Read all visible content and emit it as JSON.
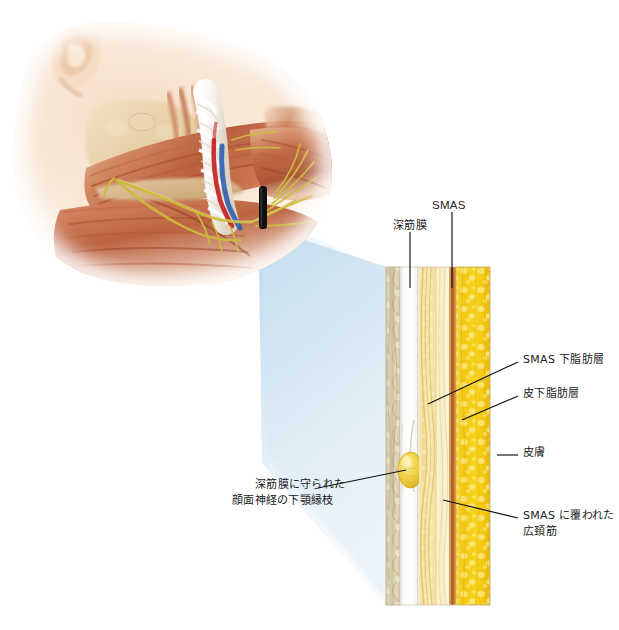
{
  "figure": {
    "type": "medical-anatomical-illustration",
    "background": "#ffffff",
    "size": {
      "width": 619,
      "height": 630
    }
  },
  "face_illustration": {
    "name": "lower-face-dissection",
    "description": "下顔面・下顎部の解剖図（表情筋・顔面神経・血管）",
    "marker": {
      "label": "",
      "shape": "vertical-black-bar",
      "color": "#101010"
    },
    "colors": {
      "skin": "#f7e2cf",
      "muscle": "#c06a4a",
      "muscle_light": "#d98f6d",
      "nerve": "#d8c44a",
      "artery": "#c02020",
      "vein": "#2a55a8",
      "bone": "#e8d7b4"
    }
  },
  "magnifier": {
    "name": "magnification-cone",
    "color": "#bcdcef",
    "description": "拡大部位を示す青い扇形"
  },
  "cross_section": {
    "name": "tissue-cross-section",
    "orientation": "vertical-strata",
    "layers": [
      {
        "id": "deep-muscle",
        "label": "",
        "color": "#d8cdae",
        "width_pct": 13
      },
      {
        "id": "deep-fascia",
        "label": "深筋膜",
        "color": "#f4f5f3",
        "width_pct": 18
      },
      {
        "id": "sub-smas-fat",
        "label": "SMAS 下脂肪層",
        "color": "#f3e3b4",
        "width_pct": 17
      },
      {
        "id": "smas-platysma",
        "label": "SMAS に覆われた広頚筋",
        "color": "#f8edc6",
        "width_pct": 12
      },
      {
        "id": "dermis",
        "label": "皮膚",
        "color": "#c47a3a",
        "width_pct": 6
      },
      {
        "id": "subcutaneous-fat",
        "label": "皮下脂肪層",
        "color": "#f2c716",
        "width_pct": 34
      }
    ],
    "nerve_inclusion": {
      "id": "marginal-mandibular-nerve",
      "shape": "ellipse",
      "color": "#f0cf3e",
      "label": "深筋膜に守られた顔面神経の下顎縁枝"
    }
  },
  "labels": {
    "top": [
      {
        "id": "smas",
        "text": "SMAS",
        "side": "top"
      },
      {
        "id": "deep-fascia",
        "text": "深筋膜",
        "side": "top"
      }
    ],
    "right": [
      {
        "id": "sub-smas-fat",
        "text": "SMAS 下脂肪層"
      },
      {
        "id": "subcutaneous-fat",
        "text": "皮下脂肪層"
      },
      {
        "id": "skin",
        "text": "皮膚"
      },
      {
        "id": "platysma-line1",
        "text": "SMAS に覆われた"
      },
      {
        "id": "platysma-line2",
        "text": "広頚筋"
      }
    ],
    "left": [
      {
        "id": "nerve-line1",
        "text": "深筋膜に守られた"
      },
      {
        "id": "nerve-line2",
        "text": "顔面神経の下顎縁枝"
      }
    ]
  }
}
